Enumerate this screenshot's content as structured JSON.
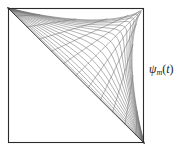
{
  "figure": {
    "kind": "mathematical-line-figure",
    "background_color": "#ffffff",
    "frame": {
      "name": "square-border",
      "x": 8,
      "y": 8,
      "width": 136,
      "height": 135,
      "stroke_color": "#2b2b2b",
      "stroke_width": 1.1
    },
    "label": {
      "symbol": "ψ",
      "subscript": "m",
      "argument_open": "(",
      "argument": "t",
      "argument_close": ")",
      "full_text": "ψm(t)",
      "x": 149,
      "y": 63,
      "color": "#1c1c1c"
    }
  },
  "chart_data": {
    "type": "line",
    "title": "",
    "subtitle": "",
    "xlabel": "",
    "ylabel": "",
    "grid": false,
    "legend_position": "right",
    "annotations": [
      {
        "text": "ψm(t)",
        "x": 149,
        "y": 70,
        "target_region": "right-of-frame"
      }
    ],
    "axis_ranges": {
      "xlim": [
        0,
        1
      ],
      "ylim": [
        0,
        1
      ]
    },
    "focus_points": [
      {
        "name": "top-left-node",
        "x": 0.0,
        "y": 1.0
      },
      {
        "name": "bottom-right-node",
        "x": 1.0,
        "y": 0.0
      }
    ],
    "series": [
      {
        "name": "ray-family",
        "role": "straight fan from top-left corner",
        "stroke_color": "#6e6e6e",
        "stroke_width": 0.55,
        "count": 17,
        "parameters": [
          0.04,
          0.09,
          0.14,
          0.2,
          0.26,
          0.32,
          0.38,
          0.45,
          0.52,
          0.59,
          0.66,
          0.72,
          0.78,
          0.84,
          0.89,
          0.94,
          0.98
        ]
      },
      {
        "name": "arc-family",
        "role": "curved transversals crossing the fan",
        "stroke_color": "#6e6e6e",
        "stroke_width": 0.55,
        "count": 11,
        "parameters": [
          0.06,
          0.14,
          0.23,
          0.32,
          0.41,
          0.5,
          0.59,
          0.68,
          0.77,
          0.86,
          0.94
        ]
      },
      {
        "name": "envelope-caustic",
        "role": "dark diagonal envelope from top-left to bottom-right",
        "stroke_color": "#2e2e2e",
        "stroke_width": 0.9,
        "count": 1,
        "parameters": [
          1.0
        ]
      }
    ]
  }
}
